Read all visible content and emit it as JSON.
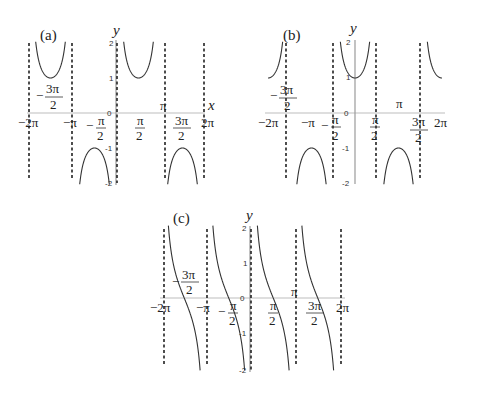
{
  "chart_data": [
    {
      "type": "line",
      "panel_label": "(a)",
      "function": "csc(x)",
      "xlabel": "x",
      "ylabel": "y",
      "xlim": [
        "-2π",
        "2π"
      ],
      "ylim": [
        -2,
        2
      ],
      "x_tick_labels": [
        "-2π",
        "-3π/2",
        "-π",
        "-π/2",
        "π/2",
        "π",
        "3π/2",
        "2π"
      ],
      "y_tick_labels": [
        "2",
        "1",
        "0",
        "-1",
        "-2"
      ],
      "asymptotes": [
        "-2π",
        "-π",
        "0",
        "π",
        "2π"
      ],
      "series": [
        {
          "name": "csc branch",
          "interval": [
            "-2π",
            "-π"
          ],
          "extremum": {
            "x": "-3π/2",
            "y": 1
          }
        },
        {
          "name": "csc branch",
          "interval": [
            "-π",
            "0"
          ],
          "extremum": {
            "x": "-π/2",
            "y": -1
          }
        },
        {
          "name": "csc branch",
          "interval": [
            "0",
            "π"
          ],
          "extremum": {
            "x": "π/2",
            "y": 1
          }
        },
        {
          "name": "csc branch",
          "interval": [
            "π",
            "2π"
          ],
          "extremum": {
            "x": "3π/2",
            "y": -1
          }
        }
      ],
      "grid": false
    },
    {
      "type": "line",
      "panel_label": "(b)",
      "function": "sec(x)",
      "ylabel": "y",
      "xlim": [
        "-2π",
        "2π"
      ],
      "ylim": [
        -2,
        2
      ],
      "x_tick_labels": [
        "-2π",
        "-3π/2",
        "-π",
        "-π/2",
        "π/2",
        "π",
        "3π/2",
        "2π"
      ],
      "y_tick_labels": [
        "2",
        "1",
        "0",
        "-1",
        "-2"
      ],
      "asymptotes": [
        "-3π/2",
        "-π/2",
        "π/2",
        "3π/2"
      ],
      "series": [
        {
          "name": "sec branch",
          "interval": [
            "-2π",
            "-3π/2"
          ],
          "extremum": {
            "x": "-2π",
            "y": 1
          }
        },
        {
          "name": "sec branch",
          "interval": [
            "-3π/2",
            "-π/2"
          ],
          "extremum": {
            "x": "-π",
            "y": -1
          }
        },
        {
          "name": "sec branch",
          "interval": [
            "-π/2",
            "π/2"
          ],
          "extremum": {
            "x": "0",
            "y": 1
          }
        },
        {
          "name": "sec branch",
          "interval": [
            "π/2",
            "3π/2"
          ],
          "extremum": {
            "x": "π",
            "y": -1
          }
        },
        {
          "name": "sec branch",
          "interval": [
            "3π/2",
            "2π"
          ],
          "extremum": {
            "x": "2π",
            "y": 1
          }
        }
      ],
      "grid": false
    },
    {
      "type": "line",
      "panel_label": "(c)",
      "function": "cot(x)",
      "ylabel": "y",
      "xlim": [
        "-2π",
        "2π"
      ],
      "ylim": [
        -2,
        2
      ],
      "x_tick_labels": [
        "-2π",
        "-3π/2",
        "-π",
        "-π/2",
        "π/2",
        "π",
        "3π/2",
        "2π"
      ],
      "y_tick_labels": [
        "2",
        "1",
        "0",
        "-1",
        "-2"
      ],
      "asymptotes": [
        "-2π",
        "-π",
        "0",
        "π",
        "2π"
      ],
      "series": [
        {
          "name": "cot branch",
          "interval": [
            "-2π",
            "-π"
          ],
          "zero": "-3π/2"
        },
        {
          "name": "cot branch",
          "interval": [
            "-π",
            "0"
          ],
          "zero": "-π/2"
        },
        {
          "name": "cot branch",
          "interval": [
            "0",
            "π"
          ],
          "zero": "π/2"
        },
        {
          "name": "cot branch",
          "interval": [
            "π",
            "2π"
          ],
          "zero": "3π/2"
        }
      ],
      "grid": false
    }
  ],
  "labels": {
    "a": {
      "panel": "(a)",
      "x": "x",
      "y": "y",
      "neg2pi": "−2π",
      "negpi": "−π",
      "pi": "π",
      "twopi": "2π",
      "three_pi": "3π",
      "pi_sym": "π",
      "two": "2",
      "minus": "−",
      "y2": "2",
      "y1": "1",
      "y0": "0",
      "ym1": "-1",
      "ym2": "-2"
    },
    "b": {
      "panel": "(b)",
      "y": "y",
      "neg2pi": "−2π",
      "negpi": "−π",
      "pi": "π",
      "twopi": "2π",
      "three_pi": "3π",
      "pi_sym": "π",
      "two": "2",
      "minus": "−",
      "y2": "2",
      "y1": "1",
      "y0": "0",
      "ym1": "-1",
      "ym2": "-2"
    },
    "c": {
      "panel": "(c)",
      "y": "y",
      "neg2pi": "−2π",
      "negpi": "−π",
      "pi": "π",
      "twopi": "2π",
      "three_pi": "3π",
      "pi_sym": "π",
      "two": "2",
      "minus": "−",
      "y2": "2",
      "y1": "1",
      "y0": "0",
      "ym1": "-1",
      "ym2": "-2"
    }
  }
}
